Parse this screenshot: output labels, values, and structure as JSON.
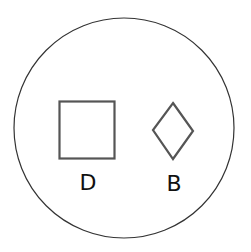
{
  "diagram": {
    "container": {
      "shape": "circle",
      "stroke": "#333333"
    },
    "shapes": [
      {
        "id": "square",
        "label": "D",
        "stroke": "#555555"
      },
      {
        "id": "diamond",
        "label": "B",
        "stroke": "#555555"
      }
    ]
  }
}
